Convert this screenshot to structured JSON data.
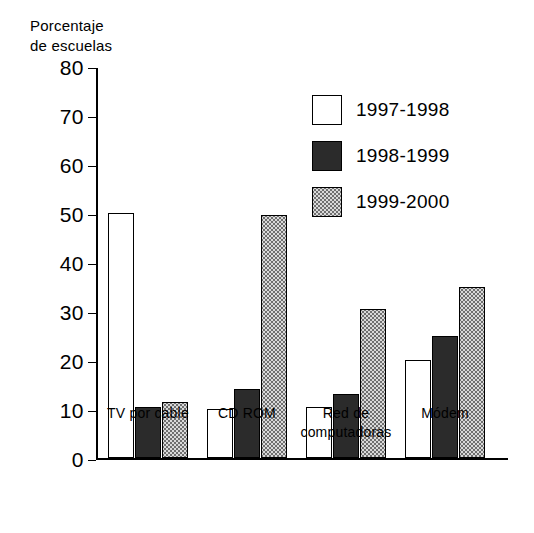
{
  "chart_data": {
    "type": "bar",
    "title": "",
    "subtitle": "",
    "ylabel": "Porcentaje\nde escuelas",
    "xlabel": "",
    "ylim": [
      0,
      80
    ],
    "ytick_values": [
      0,
      10,
      20,
      30,
      40,
      50,
      60,
      70,
      80
    ],
    "ytick_labels": [
      "0",
      "10",
      "20",
      "30",
      "40",
      "50",
      "60",
      "70",
      "80"
    ],
    "grid": false,
    "legend_position": "upper right",
    "categories": [
      "TV por cable",
      "CD ROM",
      "Red de\ncomputadoras",
      "Módem"
    ],
    "series": [
      {
        "name": "1997-1998",
        "color": "#ffffff",
        "style": "white-fill",
        "values": [
          50,
          10,
          10.5,
          20
        ]
      },
      {
        "name": "1998-1999",
        "color": "#2b2b2b",
        "style": "dark-fill",
        "values": [
          10.5,
          14,
          13,
          25
        ]
      },
      {
        "name": "1999-2000",
        "color": "#d9d9d9",
        "style": "dotted-fill",
        "values": [
          11.5,
          49.5,
          30.5,
          35
        ]
      }
    ]
  }
}
